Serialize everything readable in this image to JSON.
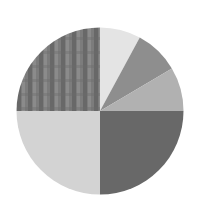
{
  "chart_data": {
    "type": "pie",
    "title": "",
    "legend": "none",
    "labels_visible": false,
    "start_angle_deg": 0,
    "direction": "clockwise",
    "categories": [
      "Slice 1",
      "Slice 2",
      "Slice 3",
      "Slice 4",
      "Slice 5",
      "Slice 6"
    ],
    "values": [
      7.9,
      8.6,
      8.5,
      25.0,
      25.0,
      25.0
    ],
    "colors": [
      "#e4e4e4",
      "#8e8e8e",
      "#b1b1b1",
      "#686868",
      "#d3d3d3",
      "#7c7c7c"
    ],
    "patterns": [
      "solid",
      "solid",
      "solid",
      "solid",
      "solid",
      "plaid"
    ]
  },
  "geometry": {
    "cx": 100,
    "cy": 111,
    "r": 83.5
  },
  "background": "#ffffff"
}
